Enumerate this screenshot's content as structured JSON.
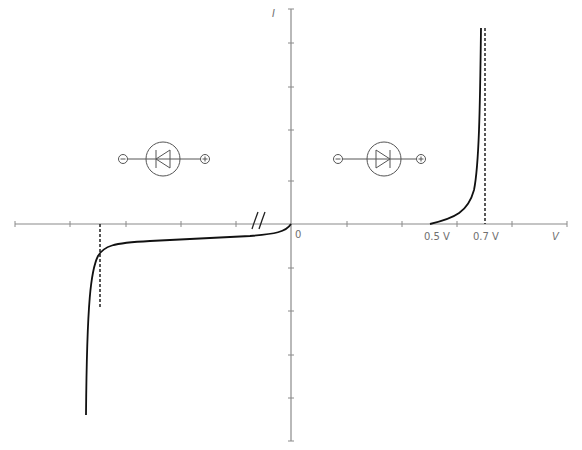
{
  "diagram": {
    "axes": {
      "x_label": "V",
      "y_label": "I",
      "origin_label": "0",
      "axis_color": "#8a8a8a",
      "x_ticks_left": [
        15,
        70,
        126,
        181,
        236
      ],
      "x_ticks_right": [
        347,
        402,
        457,
        512,
        567
      ],
      "y_ticks": [
        9,
        43,
        87,
        130,
        181,
        268,
        311,
        355,
        398,
        441
      ]
    },
    "forward_labels": {
      "threshold_low": "0.5 V",
      "threshold_high": "0.7 V"
    },
    "curve_color": "#111111",
    "symbols": {
      "reverse_bias": {
        "minus": "⊖",
        "plus": "⊕",
        "orientation": "reverse"
      },
      "forward_bias": {
        "minus": "⊖",
        "plus": "⊕",
        "orientation": "forward"
      }
    },
    "axis_break_mark": "//"
  }
}
